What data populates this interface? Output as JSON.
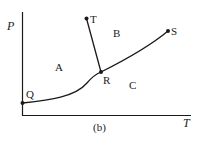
{
  "diagram": {
    "caption": "(b)",
    "axes": {
      "y_label": "P",
      "x_label": "T"
    },
    "regions": [
      {
        "label": "A"
      },
      {
        "label": "B"
      },
      {
        "label": "C"
      }
    ],
    "points": [
      {
        "label": "Q"
      },
      {
        "label": "R"
      },
      {
        "label": "T"
      },
      {
        "label": "S"
      }
    ],
    "curves": [
      "Q-R",
      "R-S",
      "R-T"
    ],
    "colors": {
      "line": "#1a1a1a"
    }
  }
}
